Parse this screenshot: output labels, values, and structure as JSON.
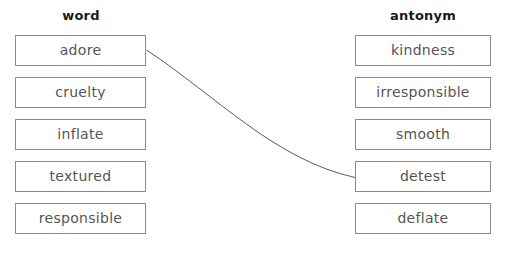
{
  "exercise": {
    "type": "matching-exercise",
    "columns": {
      "left": {
        "header": "word",
        "items": [
          {
            "label": "adore"
          },
          {
            "label": "cruelty"
          },
          {
            "label": "inflate"
          },
          {
            "label": "textured"
          },
          {
            "label": "responsible"
          }
        ]
      },
      "right": {
        "header": "antonym",
        "items": [
          {
            "label": "kindness"
          },
          {
            "label": "irresponsible"
          },
          {
            "label": "smooth"
          },
          {
            "label": "detest"
          },
          {
            "label": "deflate"
          }
        ]
      }
    },
    "connections": [
      {
        "from": "adore",
        "to": "detest"
      }
    ],
    "colors": {
      "box_border": "#8a8a8a",
      "box_text": "#555555",
      "header_text": "#1a1a1a",
      "connector": "#5a5a5a",
      "background": "#ffffff"
    }
  }
}
